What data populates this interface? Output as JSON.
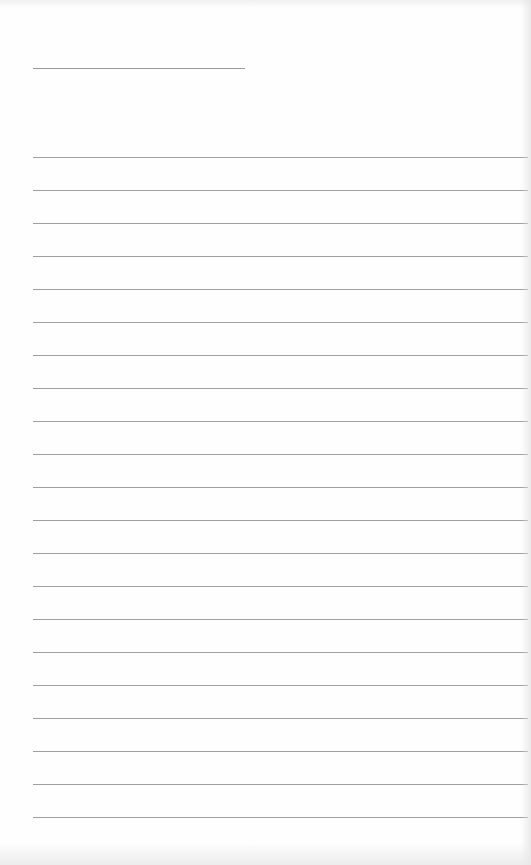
{
  "page": {
    "type": "lined-paper",
    "background_color": "#fefefe",
    "line_color": "#a0a0a0",
    "header_line": {
      "visible": true
    },
    "ruled_lines": {
      "count": 21,
      "spacing_px": 33
    },
    "text_content": []
  }
}
